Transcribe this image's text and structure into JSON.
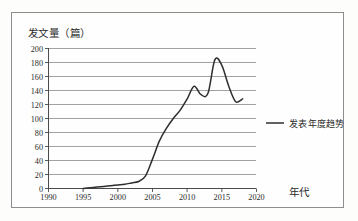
{
  "figure": {
    "kind": "line-chart-scan",
    "background_color": "#fdfdfc",
    "frame_color": "#8d8d8d",
    "ink_color": "#2e2e2e"
  },
  "chart_data": {
    "type": "line",
    "title": "",
    "subtitle": "",
    "xlabel": "年代",
    "ylabel": "发文量（篇）",
    "xlim": [
      1990,
      2020
    ],
    "ylim": [
      0,
      200
    ],
    "grid": "horizontal",
    "legend_position": "right-outside",
    "x_ticks": [
      1990,
      1995,
      2000,
      2005,
      2010,
      2015,
      2020
    ],
    "x_tick_labels": [
      "1990",
      "1995",
      "2000",
      "2005",
      "2010",
      "2015",
      "2020"
    ],
    "y_ticks": [
      0,
      20,
      40,
      60,
      80,
      100,
      120,
      140,
      160,
      180,
      200
    ],
    "y_tick_labels": [
      "0",
      "20",
      "40",
      "60",
      "80",
      "100",
      "120",
      "140",
      "160",
      "180",
      "200"
    ],
    "series": [
      {
        "name": "发表年度趋势",
        "color": "#2e2e2e",
        "x": [
          1995,
          1996,
          1997,
          1998,
          1999,
          2000,
          2001,
          2002,
          2003,
          2004,
          2005,
          2006,
          2007,
          2008,
          2009,
          2010,
          2011,
          2012,
          2013,
          2014,
          2015,
          2016,
          2017,
          2018
        ],
        "values": [
          0,
          1,
          2,
          3,
          4,
          5,
          6,
          8,
          10,
          18,
          42,
          68,
          86,
          100,
          112,
          128,
          146,
          134,
          136,
          184,
          176,
          146,
          124,
          128
        ]
      }
    ],
    "annotations": []
  },
  "legend": {
    "entries": [
      {
        "label": "发表年度趋势",
        "color": "#2e2e2e",
        "marker": "line"
      }
    ]
  },
  "axes": {
    "y_axis_title": "发文量（篇）",
    "x_axis_title": "年代"
  }
}
